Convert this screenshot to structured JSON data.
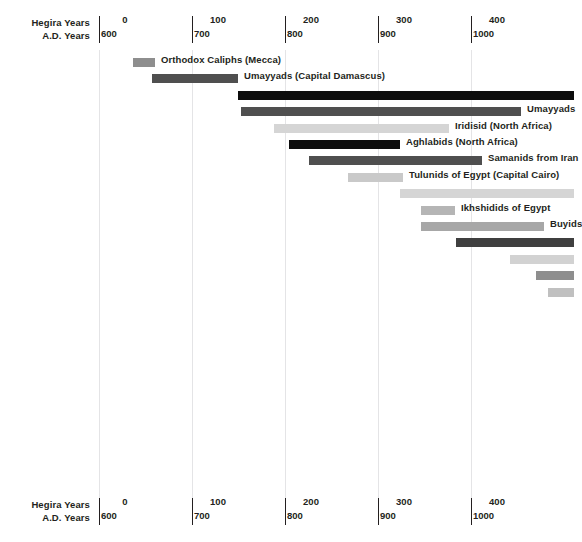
{
  "axis": {
    "row_label_hijri": "Hegira Years",
    "row_label_ad": "A.D. Years",
    "ticks": [
      {
        "hijri": "0",
        "ad": "600",
        "x": 99
      },
      {
        "hijri": "100",
        "ad": "700",
        "x": 192
      },
      {
        "hijri": "200",
        "ad": "800",
        "x": 285
      },
      {
        "hijri": "300",
        "ad": "900",
        "x": 378
      },
      {
        "hijri": "400",
        "ad": "1000",
        "x": 471
      }
    ]
  },
  "colors": {
    "black": "#0d0d0d",
    "dark_gray": "#4f4f4f",
    "mid_gray": "#8e8e8e",
    "light_gray": "#b5b5b5",
    "pale_gray": "#d5d5d5",
    "grid": "#e4e4e6",
    "text": "#231f20"
  },
  "chart_data": {
    "type": "bar",
    "title": "",
    "xlabel": "Hegira Years / A.D. Years",
    "ylabel": "",
    "orientation": "horizontal",
    "subtype": "timeline-gantt",
    "grid": true,
    "legend": "none",
    "xlim_ad": [
      600,
      1015
    ],
    "xlim_hijri": [
      -22,
      423
    ],
    "x_axis_dual": true,
    "x_ticks_hijri": [
      0,
      100,
      200,
      300,
      400
    ],
    "x_ticks_ad": [
      600,
      700,
      800,
      900,
      1000
    ],
    "series": [
      {
        "name": "Orthodox Caliphs (Mecca)",
        "label": "Orthodox Caliphs (Mecca)",
        "label_side": "right",
        "start_ad": 637,
        "end_ad": 661,
        "x_start": 133,
        "x_end": 155,
        "color": "#8e8e8e",
        "row": 0
      },
      {
        "name": "Umayyads (Capital Damascus)",
        "label": "Umayyads (Capital Damascus)",
        "label_side": "right",
        "start_ad": 657,
        "end_ad": 750,
        "x_start": 152,
        "x_end": 238,
        "color": "#4f4f4f",
        "row": 1
      },
      {
        "name": "Abbasids",
        "label": "",
        "label_side": "right",
        "start_ad": 750,
        "end_ad": 1015,
        "x_start": 238,
        "x_end": 574,
        "color": "#0d0d0d",
        "row": 2
      },
      {
        "name": "Umayyads",
        "label": "Umayyads",
        "label_side": "right",
        "start_ad": 753,
        "end_ad": 1000,
        "x_start": 241,
        "x_end": 521,
        "color": "#4f4f4f",
        "row": 3
      },
      {
        "name": "Iridisid (North Africa)",
        "label": "Iridisid (North Africa)",
        "label_side": "right",
        "start_ad": 788,
        "end_ad": 977,
        "x_start": 274,
        "x_end": 449,
        "color": "#d5d5d5",
        "row": 4
      },
      {
        "name": "Aghlabids (North Africa)",
        "label": "Aghlabids (North Africa)",
        "label_side": "right",
        "start_ad": 804,
        "end_ad": 924,
        "x_start": 289,
        "x_end": 400,
        "color": "#0d0d0d",
        "row": 5
      },
      {
        "name": "Samanids from Iran",
        "label": "Samanids from Iran",
        "label_side": "right",
        "start_ad": 826,
        "end_ad": 1012,
        "x_start": 309,
        "x_end": 482,
        "color": "#4f4f4f",
        "row": 6
      },
      {
        "name": "Tulunids of Egypt (Capital Cairo)",
        "label": "Tulunids of Egypt (Capital Cairo)",
        "label_side": "right",
        "start_ad": 868,
        "end_ad": 927,
        "x_start": 348,
        "x_end": 403,
        "color": "#c9c9c9",
        "row": 7
      },
      {
        "name": "Fatimids",
        "label": "",
        "label_side": "right",
        "start_ad": 924,
        "end_ad": 1015,
        "x_start": 400,
        "x_end": 574,
        "color": "#d5d5d5",
        "row": 8
      },
      {
        "name": "Ikhshidids of Egypt",
        "label": "Ikhshidids of Egypt",
        "label_side": "right",
        "start_ad": 946,
        "end_ad": 983,
        "x_start": 421,
        "x_end": 455,
        "color": "#b5b5b5",
        "row": 9
      },
      {
        "name": "Buyids",
        "label": "Buyids",
        "label_side": "right",
        "start_ad": 946,
        "end_ad": 1078,
        "x_start": 421,
        "x_end": 544,
        "color": "#a7a7a7",
        "row": 10
      },
      {
        "name": "Ghaznavids",
        "label": "",
        "label_side": "right",
        "start_ad": 978,
        "end_ad": 1015,
        "x_start": 456,
        "x_end": 574,
        "color": "#3f3f3f",
        "row": 11
      },
      {
        "name": "Seljuks",
        "label": "",
        "label_side": "right",
        "start_ad": 1013,
        "end_ad": 1015,
        "x_start": 510,
        "x_end": 574,
        "color": "#d2d2d2",
        "row": 12
      },
      {
        "name": "Unnamed dynasty 1",
        "label": "",
        "label_side": "right",
        "start_ad": 1041,
        "end_ad": 1015,
        "x_start": 536,
        "x_end": 574,
        "color": "#8e8e8e",
        "row": 13
      },
      {
        "name": "Unnamed dynasty 2",
        "label": "",
        "label_side": "right",
        "start_ad": 1054,
        "end_ad": 1015,
        "x_start": 548,
        "x_end": 574,
        "color": "#c0c0c0",
        "row": 14
      }
    ]
  }
}
